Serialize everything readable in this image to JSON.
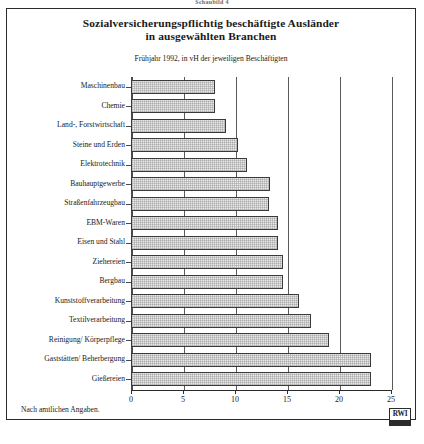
{
  "top_caption": "Schaubild 4",
  "figure": {
    "title_line1": "Sozialversicherungspflichtig beschäftigte Ausländer",
    "title_line2": "in ausgewählten Branchen",
    "subtitle": "Frühjahr 1992, in vH der jeweiligen Beschäftigten",
    "footer_note": "Nach amtlichen Angaben.",
    "logo_text": "RWI"
  },
  "chart_data": {
    "type": "bar",
    "orientation": "horizontal",
    "title": "Sozialversicherungspflichtig beschäftigte Ausländer in ausgewählten Branchen",
    "subtitle": "Frühjahr 1992, in vH der jeweiligen Beschäftigten",
    "xlabel": "",
    "ylabel": "",
    "xlim": [
      0,
      25
    ],
    "xticks": [
      0,
      5,
      10,
      15,
      20,
      25
    ],
    "xtick_labels": [
      "0",
      "5",
      "10",
      "15",
      "20",
      "25"
    ],
    "grid": "vertical",
    "legend": "none",
    "categories": [
      "Maschinenbau",
      "Chemie",
      "Land-, Forstwirtschaft",
      "Steine und Erden",
      "Elektrotechnik",
      "Bauhauptgewerbe",
      "Straßenfahrzeugbau",
      "EBM-Waren",
      "Eisen und Stahl",
      "Ziehereien",
      "Bergbau",
      "Kunststoffverarbeitung",
      "Textilverarbeitung",
      "Reinigung/ Körperpflege",
      "Gaststätten/ Beherbergung",
      "Gießereien"
    ],
    "values": [
      8.1,
      8.1,
      9.1,
      10.3,
      11.2,
      13.4,
      13.3,
      14.1,
      14.1,
      14.6,
      14.6,
      16.2,
      17.3,
      19.0,
      23.1,
      23.1
    ],
    "bar_fill": "#e9e9e9",
    "bar_edge": "#3a3a3a"
  }
}
